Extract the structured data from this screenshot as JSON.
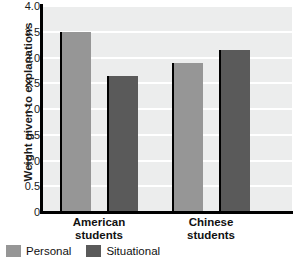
{
  "chart_data": {
    "type": "bar",
    "title": "",
    "xlabel": "",
    "ylabel": "Weight given to explanations",
    "ylim": [
      0,
      4.0
    ],
    "yticks": [
      "0",
      "0.5",
      "1.0",
      "1.5",
      "2.0",
      "2.5",
      "3.0",
      "3.5",
      "4.0"
    ],
    "ytick_values": [
      0,
      0.5,
      1.0,
      1.5,
      2.0,
      2.5,
      3.0,
      3.5,
      4.0
    ],
    "grid": true,
    "grid_axis": "y",
    "legend_position": "below-left",
    "categories": [
      "American students",
      "Chinese students"
    ],
    "category_lines": [
      [
        "American",
        "students"
      ],
      [
        "Chinese",
        "students"
      ]
    ],
    "series": [
      {
        "name": "Personal",
        "color": "#969696",
        "values": [
          3.5,
          2.9
        ]
      },
      {
        "name": "Situational",
        "color": "#5a5a5a",
        "values": [
          2.65,
          3.15
        ]
      }
    ]
  },
  "colors": {
    "personal": "#969696",
    "situational": "#5a5a5a",
    "plot_background": "#eceded",
    "gridline": "#ffffff",
    "axis": "#000000",
    "text": "#111111"
  },
  "legend": {
    "entries": [
      {
        "label": "Personal",
        "color": "#969696"
      },
      {
        "label": "Situational",
        "color": "#5a5a5a"
      }
    ]
  }
}
